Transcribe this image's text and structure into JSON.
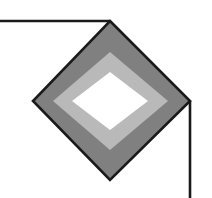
{
  "canvas": {
    "width": 212,
    "height": 198,
    "background_color": "#ffffff",
    "title": "Nested rotated-square diagram with leader lines"
  },
  "palette": {
    "stroke": "#1a1a1a",
    "outer_fill": "#808080",
    "middle_fill": "#b9b9b9",
    "inner_fill": "#ffffff",
    "background": "#ffffff"
  },
  "shapes": {
    "outer_diamond": {
      "label": "outer diamond",
      "fill": "#808080",
      "stroke": "#1a1a1a",
      "stroke_width": 2.6,
      "points": "110,21 190,101 110,180 33,101",
      "vertices": {
        "top": [
          110,
          21
        ],
        "right": [
          190,
          101
        ],
        "bottom": [
          110,
          180
        ],
        "left": [
          33,
          101
        ]
      }
    },
    "middle_diamond": {
      "label": "middle diamond",
      "fill": "#b9b9b9",
      "stroke": "none",
      "stroke_width": 0,
      "points": "110,52 168,101 110,150 53,101",
      "vertices": {
        "top": [
          110,
          52
        ],
        "right": [
          168,
          101
        ],
        "bottom": [
          110,
          150
        ],
        "left": [
          53,
          101
        ]
      }
    },
    "inner_diamond": {
      "label": "inner diamond",
      "fill": "#ffffff",
      "stroke": "none",
      "stroke_width": 0,
      "points": "110,72 148,101 110,130 72,101",
      "vertices": {
        "top": [
          110,
          72
        ],
        "right": [
          148,
          101
        ],
        "bottom": [
          110,
          130
        ],
        "left": [
          72,
          101
        ]
      }
    }
  },
  "leader_lines": {
    "top_left_line": {
      "label": "top leader line to upper vertex",
      "stroke": "#1a1a1a",
      "stroke_width": 2.6,
      "x1": -1,
      "y1": 21,
      "x2": 110,
      "y2": 21
    },
    "right_down_line": {
      "label": "right leader line from right vertex downward",
      "stroke": "#1a1a1a",
      "stroke_width": 2.6,
      "x1": 190,
      "y1": 101,
      "x2": 190,
      "y2": 199
    }
  }
}
